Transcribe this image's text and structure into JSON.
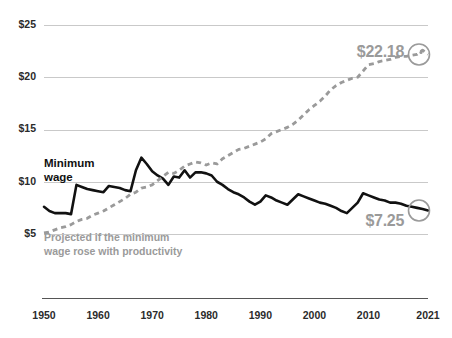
{
  "chart_data": {
    "type": "line",
    "title": "",
    "subtitle": "",
    "xlabel": "",
    "ylabel": "",
    "xlim": [
      1950,
      2021
    ],
    "ylim": [
      5,
      25
    ],
    "grid": true,
    "legend_position": "inline-annotation",
    "y_ticks": [
      "$25",
      "$20",
      "$15",
      "$10",
      "$5"
    ],
    "y_tick_values": [
      25,
      20,
      15,
      10,
      5
    ],
    "x_ticks": [
      "1950",
      "1960",
      "1970",
      "1980",
      "1990",
      "2000",
      "2010",
      "2021"
    ],
    "x_tick_values": [
      1950,
      1960,
      1970,
      1980,
      1990,
      2000,
      2010,
      2021
    ],
    "annotations": [
      {
        "name": "minimum-wage-label",
        "text": "Minimum",
        "text2": "wage",
        "color": "#111111"
      },
      {
        "name": "projected-label",
        "text": "Projected if the minimum",
        "text2": "wage rose with productivity",
        "color": "#9a9a9a"
      },
      {
        "name": "projected-endpoint-value",
        "text": "$22.18",
        "color": "#9a9a9a",
        "year": 2021,
        "value": 22.18
      },
      {
        "name": "minimum-wage-endpoint-value",
        "text": "$7.25",
        "color": "#9a9a9a",
        "year": 2021,
        "value": 7.25
      }
    ],
    "colors": {
      "minimum_wage": "#111111",
      "projected": "#9a9a9a",
      "grid": "#c9c9c9",
      "axis": "#555555"
    },
    "series": [
      {
        "name": "Minimum wage",
        "style": "solid",
        "color": "#111111",
        "x": [
          1950,
          1951,
          1952,
          1953,
          1954,
          1955,
          1956,
          1957,
          1958,
          1959,
          1960,
          1961,
          1962,
          1963,
          1964,
          1965,
          1966,
          1967,
          1968,
          1969,
          1970,
          1971,
          1972,
          1973,
          1974,
          1975,
          1976,
          1977,
          1978,
          1979,
          1980,
          1981,
          1982,
          1983,
          1984,
          1985,
          1986,
          1987,
          1988,
          1989,
          1990,
          1991,
          1992,
          1993,
          1994,
          1995,
          1996,
          1997,
          1998,
          1999,
          2000,
          2001,
          2002,
          2003,
          2004,
          2005,
          2006,
          2007,
          2008,
          2009,
          2010,
          2011,
          2012,
          2013,
          2014,
          2015,
          2016,
          2017,
          2018,
          2019,
          2020,
          2021
        ],
        "values": [
          7.6,
          7.2,
          7.0,
          7.0,
          7.0,
          6.9,
          9.7,
          9.5,
          9.3,
          9.2,
          9.1,
          9.0,
          9.6,
          9.5,
          9.4,
          9.2,
          9.1,
          11.1,
          12.3,
          11.7,
          11.0,
          10.6,
          10.3,
          9.7,
          10.5,
          10.4,
          11.1,
          10.4,
          10.9,
          10.9,
          10.8,
          10.6,
          10.0,
          9.7,
          9.3,
          9.0,
          8.8,
          8.5,
          8.1,
          7.8,
          8.1,
          8.7,
          8.5,
          8.2,
          8.0,
          7.8,
          8.3,
          8.8,
          8.6,
          8.4,
          8.2,
          8.0,
          7.9,
          7.7,
          7.5,
          7.2,
          7.0,
          7.5,
          8.0,
          8.9,
          8.7,
          8.5,
          8.3,
          8.2,
          8.0,
          8.0,
          7.9,
          7.7,
          7.6,
          7.5,
          7.4,
          7.25
        ]
      },
      {
        "name": "Projected if the minimum wage rose with productivity",
        "style": "dashed",
        "color": "#9a9a9a",
        "x": [
          1950,
          1951,
          1952,
          1953,
          1954,
          1955,
          1956,
          1957,
          1958,
          1959,
          1960,
          1961,
          1962,
          1963,
          1964,
          1965,
          1966,
          1967,
          1968,
          1969,
          1970,
          1971,
          1972,
          1973,
          1974,
          1975,
          1976,
          1977,
          1978,
          1979,
          1980,
          1981,
          1982,
          1983,
          1984,
          1985,
          1986,
          1987,
          1988,
          1989,
          1990,
          1991,
          1992,
          1993,
          1994,
          1995,
          1996,
          1997,
          1998,
          1999,
          2000,
          2001,
          2002,
          2003,
          2004,
          2005,
          2006,
          2007,
          2008,
          2009,
          2010,
          2011,
          2012,
          2013,
          2014,
          2015,
          2016,
          2017,
          2018,
          2019,
          2020,
          2021
        ],
        "values": [
          5.1,
          5.2,
          5.4,
          5.6,
          5.7,
          5.9,
          6.2,
          6.4,
          6.5,
          6.8,
          7.0,
          7.2,
          7.5,
          7.8,
          8.1,
          8.4,
          8.8,
          9.0,
          9.4,
          9.5,
          9.7,
          10.1,
          10.5,
          10.9,
          10.8,
          11.1,
          11.5,
          11.7,
          11.9,
          11.8,
          11.6,
          11.8,
          11.7,
          12.2,
          12.5,
          12.8,
          13.1,
          13.2,
          13.4,
          13.6,
          13.8,
          14.1,
          14.6,
          14.8,
          15.0,
          15.2,
          15.5,
          15.9,
          16.4,
          16.9,
          17.3,
          17.7,
          18.2,
          18.8,
          19.2,
          19.5,
          19.7,
          19.9,
          20.0,
          20.6,
          21.2,
          21.3,
          21.5,
          21.6,
          21.7,
          21.9,
          22.0,
          22.0,
          22.1,
          22.2,
          22.6,
          22.18
        ]
      }
    ]
  }
}
